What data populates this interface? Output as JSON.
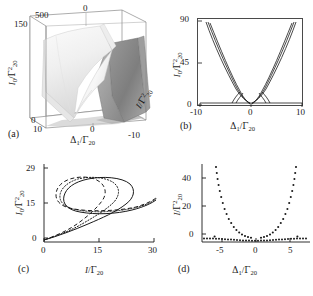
{
  "figure": {
    "panels": [
      "(a)",
      "(b)",
      "(c)",
      "(d)"
    ],
    "symbols": {
      "I0_over_G2": "I₀/Γ²₂₀",
      "I_over_G2": "I/Γ²₂₀",
      "I_over_G": "I/Γ₂₀",
      "delta_over_G": "Δ₁/Γ₂₀"
    }
  },
  "panel_a": {
    "label": "(a)",
    "type": "surface3d",
    "zlabel": "I₀/Γ²₂₀",
    "xlabel": "Δ₁/Γ₂₀",
    "ylabel": "I/Γ²₂₀",
    "z_ticks": [
      "150",
      "0"
    ],
    "x_ticks": [
      "10",
      "0",
      "-10"
    ],
    "y_ticks": [
      "500",
      "0"
    ],
    "zlim": [
      0,
      150
    ],
    "xlim": [
      10,
      -10
    ],
    "ylim": [
      0,
      500
    ],
    "surface_color_light": "#f2f2f2",
    "surface_color_dark": "#8e8e8e"
  },
  "panel_b": {
    "label": "(b)",
    "type": "line",
    "ylabel": "I₀/Γ²₂₀",
    "xlabel": "Δ₁/Γ₂₀",
    "y_ticks": [
      "0",
      "45",
      "90"
    ],
    "x_ticks": [
      "-10",
      "0",
      "10"
    ],
    "ylim": [
      0,
      90
    ],
    "xlim": [
      -10,
      10
    ],
    "grid": false,
    "series": [
      {
        "name": "branch-outer-left"
      },
      {
        "name": "branch-mid-left"
      },
      {
        "name": "branch-inner-left"
      },
      {
        "name": "branch-inner-right"
      },
      {
        "name": "branch-mid-right"
      },
      {
        "name": "branch-outer-right"
      },
      {
        "name": "baseline"
      }
    ]
  },
  "panel_c": {
    "label": "(c)",
    "type": "line",
    "ylabel": "I₀/Γ²₂₀",
    "xlabel": "I/Γ₂₀",
    "y_ticks": [
      "0",
      "15",
      "29"
    ],
    "x_ticks": [
      "0",
      "15",
      "30"
    ],
    "ylim": [
      0,
      32
    ],
    "xlim": [
      0,
      30
    ],
    "grid": false,
    "series": [
      {
        "name": "solid-curve",
        "style": "solid"
      },
      {
        "name": "dotted-curve",
        "style": "dotted"
      },
      {
        "name": "dashed-curve",
        "style": "dashed"
      }
    ]
  },
  "panel_d": {
    "label": "(d)",
    "type": "scatter",
    "ylabel": "I/Γ²₂₀",
    "xlabel": "Δ₁/Γ₂₀",
    "y_ticks": [
      "0",
      "20",
      "40"
    ],
    "x_ticks": [
      "-5",
      "0",
      "5"
    ],
    "ylim": [
      -3,
      52
    ],
    "xlim": [
      -7,
      7
    ],
    "grid": false,
    "marker": "dot",
    "marker_color": "#1a1a1a"
  }
}
